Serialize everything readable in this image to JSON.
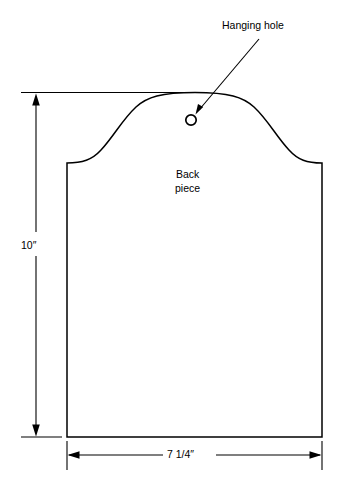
{
  "diagram": {
    "line_color": "#000000",
    "background_color": "#ffffff",
    "annotations": {
      "hanging_hole": "Hanging hole",
      "part_label_line1": "Back",
      "part_label_line2": "piece"
    },
    "dimensions": {
      "height": "10″",
      "width": "7 1/4″"
    },
    "icons": {
      "hole": "hanging-hole-circle",
      "leader": "leader-arrow"
    }
  }
}
